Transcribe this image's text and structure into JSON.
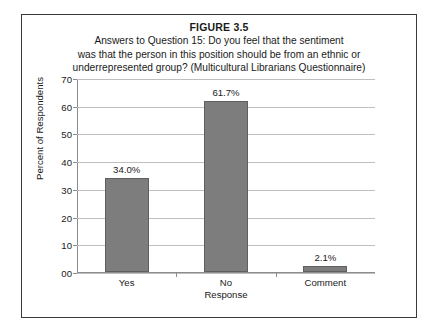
{
  "figure": {
    "number": "FIGURE 3.5",
    "caption_lines": [
      "Answers to Question 15: Do you feel that the sentiment",
      "was that the person in this position should be from an ethnic or",
      "underrepresented group? (Multicultural Librarians Questionnaire)"
    ]
  },
  "chart_data": {
    "type": "bar",
    "title": "Answers to Question 15: Do you feel that the sentiment was that the person in this position should be from an ethnic or underrepresented group? (Multicultural Librarians Questionnaire)",
    "xlabel": "Response",
    "ylabel": "Percent of Respondents",
    "categories": [
      "Yes",
      "No",
      "Comment"
    ],
    "values": [
      34.0,
      61.7,
      2.1
    ],
    "data_labels": [
      "34.0%",
      "61.7%",
      "2.1%"
    ],
    "ylim": [
      0,
      70
    ],
    "ytick_labels": [
      "00",
      "10",
      "20",
      "30",
      "40",
      "50",
      "60",
      "70"
    ],
    "ytick_values": [
      0,
      10,
      20,
      30,
      40,
      50,
      60,
      70
    ],
    "grid": true,
    "legend": "none",
    "bar_color": "#7d7d7d",
    "bar_edge_color": "#5f5f5f",
    "gridline_color": "#bfbfbf",
    "axis_color": "#8c8c8c"
  }
}
